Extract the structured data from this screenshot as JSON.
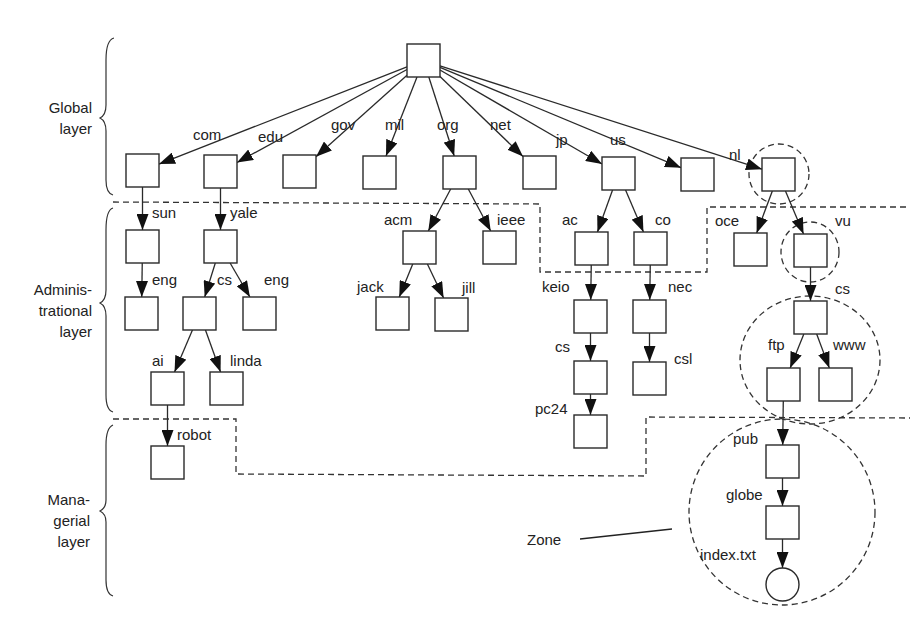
{
  "layers": {
    "global": [
      "Global",
      "layer"
    ],
    "administrational": [
      "Adminis-",
      "trational",
      "layer"
    ],
    "managerial": [
      "Mana-",
      "gerial",
      "layer"
    ]
  },
  "zone_label": "Zone",
  "nodes": [
    {
      "id": "root",
      "x": 407,
      "y": 44,
      "label": ""
    },
    {
      "id": "com",
      "x": 126,
      "y": 154,
      "label": "com",
      "lx": 193,
      "ly": 140
    },
    {
      "id": "edu",
      "x": 204,
      "y": 155,
      "label": "edu",
      "lx": 258,
      "ly": 142
    },
    {
      "id": "gov",
      "x": 283,
      "y": 155,
      "label": "gov",
      "lx": 331,
      "ly": 130
    },
    {
      "id": "mil",
      "x": 363,
      "y": 156,
      "label": "mil",
      "lx": 385,
      "ly": 130
    },
    {
      "id": "org",
      "x": 443,
      "y": 156,
      "label": "org",
      "lx": 437,
      "ly": 130
    },
    {
      "id": "net",
      "x": 523,
      "y": 156,
      "label": "net",
      "lx": 490,
      "ly": 130
    },
    {
      "id": "jp",
      "x": 602,
      "y": 157,
      "label": "jp",
      "lx": 556,
      "ly": 145
    },
    {
      "id": "us",
      "x": 681,
      "y": 158,
      "label": "us",
      "lx": 610,
      "ly": 145
    },
    {
      "id": "nl",
      "x": 762,
      "y": 158,
      "label": "nl",
      "lx": 729,
      "ly": 160
    },
    {
      "id": "sun",
      "x": 126,
      "y": 230,
      "label": "sun",
      "lx": 152,
      "ly": 218
    },
    {
      "id": "yale",
      "x": 204,
      "y": 230,
      "label": "yale",
      "lx": 230,
      "ly": 218
    },
    {
      "id": "sun-eng",
      "x": 125,
      "y": 297,
      "label": "eng",
      "lx": 152,
      "ly": 285
    },
    {
      "id": "yale-cs",
      "x": 183,
      "y": 297,
      "label": "cs",
      "lx": 217,
      "ly": 285
    },
    {
      "id": "yale-eng",
      "x": 243,
      "y": 297,
      "label": "eng",
      "lx": 264,
      "ly": 285
    },
    {
      "id": "ai",
      "x": 151,
      "y": 372,
      "label": "ai",
      "lx": 152,
      "ly": 366
    },
    {
      "id": "linda",
      "x": 210,
      "y": 372,
      "label": "linda",
      "lx": 230,
      "ly": 366
    },
    {
      "id": "robot",
      "x": 151,
      "y": 446,
      "label": "robot",
      "lx": 177,
      "ly": 440
    },
    {
      "id": "acm",
      "x": 403,
      "y": 231,
      "label": "acm",
      "lx": 384,
      "ly": 225
    },
    {
      "id": "ieee",
      "x": 483,
      "y": 231,
      "label": "ieee",
      "lx": 497,
      "ly": 225
    },
    {
      "id": "jack",
      "x": 376,
      "y": 297,
      "label": "jack",
      "lx": 357,
      "ly": 292
    },
    {
      "id": "jill",
      "x": 435,
      "y": 298,
      "label": "jill",
      "lx": 462,
      "ly": 293
    },
    {
      "id": "ac",
      "x": 575,
      "y": 232,
      "label": "ac",
      "lx": 562,
      "ly": 225
    },
    {
      "id": "co",
      "x": 634,
      "y": 232,
      "label": "co",
      "lx": 655,
      "ly": 225
    },
    {
      "id": "keio",
      "x": 574,
      "y": 300,
      "label": "keio",
      "lx": 542,
      "ly": 292
    },
    {
      "id": "nec",
      "x": 633,
      "y": 300,
      "label": "nec",
      "lx": 668,
      "ly": 292
    },
    {
      "id": "keio-cs",
      "x": 574,
      "y": 361,
      "label": "cs",
      "lx": 555,
      "ly": 352
    },
    {
      "id": "csl",
      "x": 633,
      "y": 362,
      "label": "csl",
      "lx": 674,
      "ly": 364
    },
    {
      "id": "pc24",
      "x": 574,
      "y": 415,
      "label": "pc24",
      "lx": 535,
      "ly": 414
    },
    {
      "id": "oce",
      "x": 734,
      "y": 233,
      "label": "oce",
      "lx": 715,
      "ly": 226
    },
    {
      "id": "vu",
      "x": 794,
      "y": 234,
      "label": "vu",
      "lx": 835,
      "ly": 226
    },
    {
      "id": "vu-cs",
      "x": 794,
      "y": 301,
      "label": "cs",
      "lx": 835,
      "ly": 294
    },
    {
      "id": "ftp",
      "x": 767,
      "y": 368,
      "label": "ftp",
      "lx": 768,
      "ly": 350
    },
    {
      "id": "www",
      "x": 819,
      "y": 368,
      "label": "www",
      "lx": 833,
      "ly": 350
    },
    {
      "id": "pub",
      "x": 766,
      "y": 445,
      "label": "pub",
      "lx": 733,
      "ly": 444
    },
    {
      "id": "globe",
      "x": 766,
      "y": 506,
      "label": "globe",
      "lx": 726,
      "ly": 500
    },
    {
      "id": "index",
      "x": 766,
      "y": 568,
      "label": "index.txt",
      "lx": 700,
      "ly": 560,
      "shape": "circle"
    }
  ],
  "edges": [
    [
      "root",
      "com"
    ],
    [
      "root",
      "edu"
    ],
    [
      "root",
      "gov"
    ],
    [
      "root",
      "mil"
    ],
    [
      "root",
      "org"
    ],
    [
      "root",
      "net"
    ],
    [
      "root",
      "jp"
    ],
    [
      "root",
      "us"
    ],
    [
      "root",
      "nl"
    ],
    [
      "com",
      "sun"
    ],
    [
      "edu",
      "yale"
    ],
    [
      "sun",
      "sun-eng"
    ],
    [
      "yale",
      "yale-cs"
    ],
    [
      "yale",
      "yale-eng"
    ],
    [
      "yale-cs",
      "ai"
    ],
    [
      "yale-cs",
      "linda"
    ],
    [
      "ai",
      "robot"
    ],
    [
      "org",
      "acm"
    ],
    [
      "org",
      "ieee"
    ],
    [
      "acm",
      "jack"
    ],
    [
      "acm",
      "jill"
    ],
    [
      "jp",
      "ac"
    ],
    [
      "jp",
      "co"
    ],
    [
      "ac",
      "keio"
    ],
    [
      "co",
      "nec"
    ],
    [
      "keio",
      "keio-cs"
    ],
    [
      "nec",
      "csl"
    ],
    [
      "keio-cs",
      "pc24"
    ],
    [
      "nl",
      "oce"
    ],
    [
      "nl",
      "vu"
    ],
    [
      "vu",
      "vu-cs"
    ],
    [
      "vu-cs",
      "ftp"
    ],
    [
      "vu-cs",
      "www"
    ],
    [
      "ftp",
      "pub"
    ],
    [
      "pub",
      "globe"
    ],
    [
      "globe",
      "index"
    ]
  ]
}
